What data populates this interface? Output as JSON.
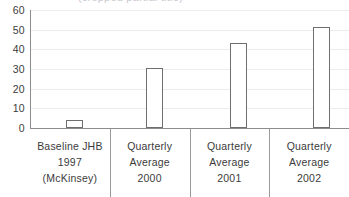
{
  "chart_data": {
    "type": "bar",
    "title": "(cropped partial title)",
    "xlabel": "",
    "ylabel": "",
    "ylim": [
      0,
      60
    ],
    "yticks": [
      0,
      10,
      20,
      30,
      40,
      50,
      60
    ],
    "grid": true,
    "legend": false,
    "categories": [
      "Baseline JHB 1997 (McKinsey)",
      "Quarterly Average 2000",
      "Quarterly Average 2001",
      "Quarterly Average 2002"
    ],
    "category_lines": [
      [
        "Baseline JHB",
        "1997",
        "(McKinsey)"
      ],
      [
        "Quarterly",
        "Average",
        "2000"
      ],
      [
        "Quarterly",
        "Average",
        "2001"
      ],
      [
        "Quarterly",
        "Average",
        "2002"
      ]
    ],
    "values": [
      4,
      30.5,
      43,
      51
    ],
    "bar_style": {
      "fill": "#ffffff",
      "stroke": "#6f6f6f"
    }
  },
  "axis": {
    "tick_0": "0",
    "tick_10": "10",
    "tick_20": "20",
    "tick_30": "30",
    "tick_40": "40",
    "tick_50": "50",
    "tick_60": "60"
  },
  "categories": {
    "c0": {
      "l0": "Baseline JHB",
      "l1": "1997",
      "l2": "(McKinsey)"
    },
    "c1": {
      "l0": "Quarterly",
      "l1": "Average",
      "l2": "2000"
    },
    "c2": {
      "l0": "Quarterly",
      "l1": "Average",
      "l2": "2001"
    },
    "c3": {
      "l0": "Quarterly",
      "l1": "Average",
      "l2": "2002"
    }
  },
  "title": {
    "text": "(cropped partial title)"
  },
  "colors": {
    "bar_stroke": "#6f6f6f",
    "axis": "#8d8d8d",
    "grid": "#ececec",
    "text": "#3b3b3b",
    "background": "#ffffff"
  }
}
